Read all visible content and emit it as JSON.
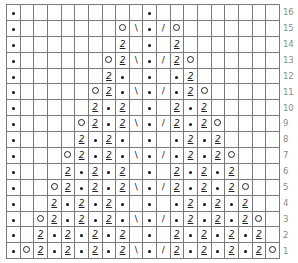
{
  "chart": {
    "columns": 20,
    "legend": {
      "k": "purl-dot",
      "o": "yarn-over",
      "t": "twisted-stitch",
      "ssk": "\\",
      "k2tog": "/"
    },
    "glyphs": {
      "t": "2",
      "ssk": "\\",
      "k2tog": "/"
    },
    "rows": [
      {
        "label": "16",
        "cells": [
          "k",
          "",
          "",
          "",
          "",
          "",
          "",
          "",
          "",
          "",
          "k",
          "",
          "",
          "",
          "",
          "",
          "",
          "",
          "",
          ""
        ]
      },
      {
        "label": "15",
        "cells": [
          "k",
          "",
          "",
          "",
          "",
          "",
          "",
          "",
          "o",
          "ssk",
          "k",
          "k2tog",
          "o",
          "",
          "",
          "",
          "",
          "",
          "",
          ""
        ]
      },
      {
        "label": "14",
        "cells": [
          "k",
          "",
          "",
          "",
          "",
          "",
          "",
          "",
          "t",
          "",
          "k",
          "",
          "t",
          "",
          "",
          "",
          "",
          "",
          "",
          ""
        ]
      },
      {
        "label": "13",
        "cells": [
          "k",
          "",
          "",
          "",
          "",
          "",
          "",
          "o",
          "t",
          "ssk",
          "k",
          "k2tog",
          "t",
          "o",
          "",
          "",
          "",
          "",
          "",
          ""
        ]
      },
      {
        "label": "12",
        "cells": [
          "k",
          "",
          "",
          "",
          "",
          "",
          "",
          "t",
          "k",
          "",
          "k",
          "",
          "k",
          "t",
          "",
          "",
          "",
          "",
          "",
          ""
        ]
      },
      {
        "label": "11",
        "cells": [
          "k",
          "",
          "",
          "",
          "",
          "",
          "o",
          "t",
          "k",
          "ssk",
          "k",
          "k2tog",
          "k",
          "t",
          "o",
          "",
          "",
          "",
          "",
          ""
        ]
      },
      {
        "label": "10",
        "cells": [
          "k",
          "",
          "",
          "",
          "",
          "",
          "t",
          "k",
          "t",
          "",
          "k",
          "",
          "t",
          "k",
          "t",
          "",
          "",
          "",
          "",
          ""
        ]
      },
      {
        "label": "9",
        "cells": [
          "k",
          "",
          "",
          "",
          "",
          "o",
          "t",
          "k",
          "t",
          "ssk",
          "k",
          "k2tog",
          "t",
          "k",
          "t",
          "o",
          "",
          "",
          "",
          ""
        ]
      },
      {
        "label": "8",
        "cells": [
          "k",
          "",
          "",
          "",
          "",
          "t",
          "k",
          "t",
          "k",
          "",
          "k",
          "",
          "k",
          "t",
          "k",
          "t",
          "",
          "",
          "",
          ""
        ]
      },
      {
        "label": "7",
        "cells": [
          "k",
          "",
          "",
          "",
          "o",
          "t",
          "k",
          "t",
          "k",
          "ssk",
          "k",
          "k2tog",
          "k",
          "t",
          "k",
          "t",
          "o",
          "",
          "",
          ""
        ]
      },
      {
        "label": "6",
        "cells": [
          "k",
          "",
          "",
          "",
          "t",
          "k",
          "t",
          "k",
          "t",
          "",
          "k",
          "",
          "t",
          "k",
          "t",
          "k",
          "t",
          "",
          "",
          ""
        ]
      },
      {
        "label": "5",
        "cells": [
          "k",
          "",
          "",
          "o",
          "t",
          "k",
          "t",
          "k",
          "t",
          "ssk",
          "k",
          "k2tog",
          "t",
          "k",
          "t",
          "k",
          "t",
          "o",
          "",
          ""
        ]
      },
      {
        "label": "4",
        "cells": [
          "k",
          "",
          "",
          "t",
          "k",
          "t",
          "k",
          "t",
          "k",
          "",
          "k",
          "",
          "k",
          "t",
          "k",
          "t",
          "k",
          "t",
          "",
          ""
        ]
      },
      {
        "label": "3",
        "cells": [
          "k",
          "",
          "o",
          "t",
          "k",
          "t",
          "k",
          "t",
          "k",
          "ssk",
          "k",
          "k2tog",
          "k",
          "t",
          "k",
          "t",
          "k",
          "t",
          "o",
          ""
        ]
      },
      {
        "label": "2",
        "cells": [
          "k",
          "",
          "t",
          "k",
          "t",
          "k",
          "t",
          "k",
          "t",
          "",
          "k",
          "",
          "t",
          "k",
          "t",
          "k",
          "t",
          "k",
          "t",
          ""
        ]
      },
      {
        "label": "1",
        "cells": [
          "k",
          "o",
          "t",
          "k",
          "t",
          "k",
          "t",
          "k",
          "t",
          "ssk",
          "k",
          "k2tog",
          "t",
          "k",
          "t",
          "k",
          "t",
          "k",
          "t",
          "o"
        ]
      }
    ]
  }
}
